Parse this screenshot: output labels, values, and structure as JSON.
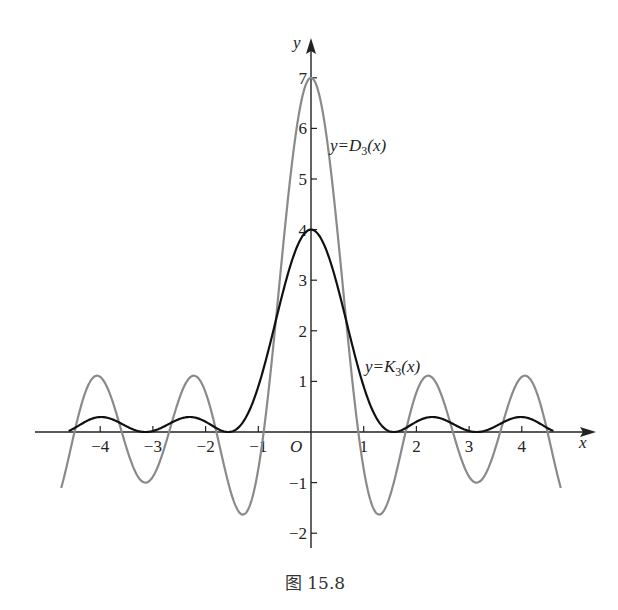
{
  "chart_data": {
    "type": "line",
    "title": "",
    "caption": "图 15.8",
    "xlabel": "x",
    "ylabel": "y",
    "origin_label": "O",
    "xlim": [
      -4.7,
      4.7
    ],
    "ylim": [
      -2,
      7
    ],
    "x_ticks": [
      -4,
      -3,
      -2,
      -1,
      1,
      2,
      3,
      4
    ],
    "x_tick_labels": [
      "−4",
      "−3",
      "−2",
      "−1",
      "1",
      "2",
      "3",
      "4"
    ],
    "y_ticks": [
      -2,
      -1,
      1,
      2,
      3,
      4,
      5,
      6,
      7
    ],
    "y_tick_labels": [
      "−2",
      "−1",
      "1",
      "2",
      "3",
      "4",
      "5",
      "6",
      "7"
    ],
    "grid": false,
    "series": [
      {
        "name": "y=D₃(x)",
        "label": "y=D_3(x)",
        "formula": "sin(3.5x)/sin(x/2)",
        "color": "#8a8a8a",
        "max": 7,
        "label_pos": [
          330,
          151
        ]
      },
      {
        "name": "y=K₃(x)",
        "label": "y=K_3(x)",
        "formula": "(1/4)(sin(2x)/sin(x/2))^2",
        "color": "#111111",
        "max": 4,
        "label_pos": [
          365,
          372
        ]
      }
    ],
    "sample_points": {
      "x": [
        -4,
        -3,
        -2,
        -1,
        0,
        1,
        2,
        3,
        4
      ],
      "D3": [
        1.07,
        -0.98,
        0.88,
        -0.37,
        7,
        -0.37,
        0.88,
        -0.98,
        1.07
      ],
      "K3": [
        0.25,
        0.0,
        0.22,
        0.04,
        4,
        0.04,
        0.22,
        0.0,
        0.25
      ]
    }
  }
}
